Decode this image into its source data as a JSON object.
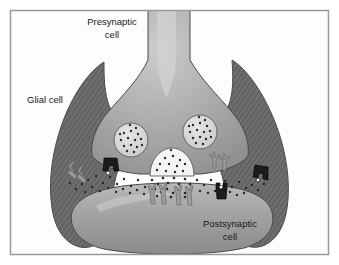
{
  "figure": {
    "frame": {
      "border_color": "#9a9a9a",
      "background_color": "#ffffff",
      "inset_px": 10
    },
    "labels": [
      {
        "id": "presynaptic",
        "line1": "Presynaptic",
        "line2": "cell",
        "x": 112,
        "y": 28
      },
      {
        "id": "glial",
        "line1": "Glial cell",
        "line2": "",
        "x": 45,
        "y": 100
      },
      {
        "id": "postsynaptic",
        "line1": "Postsynaptic",
        "line2": "cell",
        "x": 230,
        "y": 225
      }
    ],
    "colors": {
      "glial_cell": "#6e6e6e",
      "glial_hatch": "#565656",
      "presynaptic_cell": "#a8a8a8",
      "presynaptic_highlight": "#cfcfcf",
      "postsynaptic_cell": "#a3a3a3",
      "postsynaptic_highlight": "#c4c4c4",
      "vesicle_fill": "#d8d8d8",
      "vesicle_dot": "#2b2b2b",
      "neurotransmitter_dot": "#262626",
      "transporter_dark": "#1c1c1c",
      "receptor_light": "#9c9c9c",
      "outline": "#4a4a4a",
      "cleft": "#ffffff",
      "label_text": "#1a1a1a"
    },
    "structures": [
      {
        "name": "axon-terminal",
        "type": "presynaptic-bouton",
        "count": 1
      },
      {
        "name": "glial-cell-left",
        "type": "astrocyte-process",
        "count": 1
      },
      {
        "name": "glial-cell-right",
        "type": "astrocyte-process",
        "count": 1
      },
      {
        "name": "postsynaptic-cell",
        "type": "dendrite",
        "count": 1
      },
      {
        "name": "synaptic-vesicle",
        "type": "vesicle",
        "count": 2
      },
      {
        "name": "fusing-vesicle",
        "type": "omega-figure",
        "count": 1
      },
      {
        "name": "presynaptic-transporter",
        "type": "transporter",
        "count": 2
      },
      {
        "name": "glial-transporter",
        "type": "transporter",
        "count": 2
      },
      {
        "name": "postsynaptic-transporter",
        "type": "transporter",
        "count": 1
      },
      {
        "name": "postsynaptic-receptor",
        "type": "receptor",
        "count": 4
      },
      {
        "name": "glial-receptor",
        "type": "receptor",
        "count": 2
      },
      {
        "name": "presynaptic-receptor",
        "type": "receptor",
        "count": 2
      },
      {
        "name": "neurotransmitter",
        "type": "molecule-dot",
        "count": 120
      }
    ]
  }
}
